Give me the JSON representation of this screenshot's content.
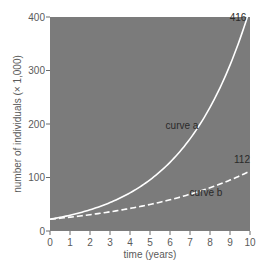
{
  "chart_data": {
    "type": "line",
    "title": "",
    "xlabel": "time (years)",
    "ylabel": "number of individuals (× 1,000)",
    "xlim": [
      0,
      10
    ],
    "ylim": [
      0,
      400
    ],
    "x_ticks": [
      0,
      1,
      2,
      3,
      4,
      5,
      6,
      7,
      8,
      9,
      10
    ],
    "y_ticks": [
      0,
      100,
      200,
      300,
      400
    ],
    "grid": false,
    "legend": "none (inline curve labels)",
    "background_color": "#7b7b7b",
    "x": [
      0,
      1,
      2,
      3,
      4,
      5,
      6,
      7,
      8,
      9,
      10
    ],
    "series": [
      {
        "name": "curve a",
        "style": "solid",
        "color": "#ffffff",
        "values": [
          22,
          30,
          40,
          53,
          72,
          95,
          129,
          173,
          232,
          311,
          416
        ],
        "end_label": "416"
      },
      {
        "name": "curve b",
        "style": "dashed",
        "color": "#ffffff",
        "values": [
          22,
          26,
          30,
          36,
          42,
          50,
          58,
          69,
          81,
          95,
          112
        ],
        "end_label": "112"
      }
    ],
    "annotations": [
      {
        "text": "curve a",
        "x": 6.6,
        "y": 190
      },
      {
        "text": "curve b",
        "x": 7.8,
        "y": 66
      },
      {
        "text": "416",
        "x": 9.4,
        "y": 392
      },
      {
        "text": "112",
        "x": 9.6,
        "y": 128
      }
    ]
  }
}
